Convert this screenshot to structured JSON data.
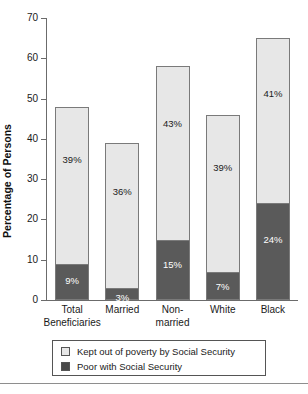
{
  "chart_data": {
    "type": "bar",
    "title": "",
    "xlabel": "",
    "ylabel": "Percentage of Persons",
    "ylim": [
      0,
      70
    ],
    "yticks": [
      0,
      10,
      20,
      30,
      40,
      50,
      60,
      70
    ],
    "grid": false,
    "stacked": true,
    "legend_position": "bottom",
    "categories": [
      "Total Beneficiaries",
      "Married",
      "Non-married",
      "White",
      "Black"
    ],
    "category_lines": [
      {
        "line1": "Total",
        "line2": "Beneficiaries"
      },
      {
        "line1": "Married",
        "line2": ""
      },
      {
        "line1": "Non-",
        "line2": "married"
      },
      {
        "line1": "White",
        "line2": ""
      },
      {
        "line1": "Black",
        "line2": ""
      }
    ],
    "series": [
      {
        "name": "Poor with Social Security",
        "color": "#5a5a5a",
        "values": [
          9,
          3,
          15,
          7,
          24
        ],
        "labels": [
          "9%",
          "3%",
          "15%",
          "7%",
          "24%"
        ]
      },
      {
        "name": "Kept out of poverty by Social Security",
        "color": "#e7e7e7",
        "values": [
          39,
          36,
          43,
          39,
          41
        ],
        "labels": [
          "39%",
          "36%",
          "43%",
          "39%",
          "41%"
        ]
      }
    ],
    "totals": [
      48,
      39,
      58,
      46,
      65
    ]
  },
  "axis": {
    "tick_labels": [
      "70",
      "60",
      "50",
      "40",
      "30",
      "20",
      "10",
      "0"
    ],
    "y_title": "Percentage of Persons"
  },
  "legend": {
    "items": [
      {
        "swatch": "light",
        "label": "Kept out of poverty by Social Security"
      },
      {
        "swatch": "dark",
        "label": "Poor with Social Security"
      }
    ]
  }
}
